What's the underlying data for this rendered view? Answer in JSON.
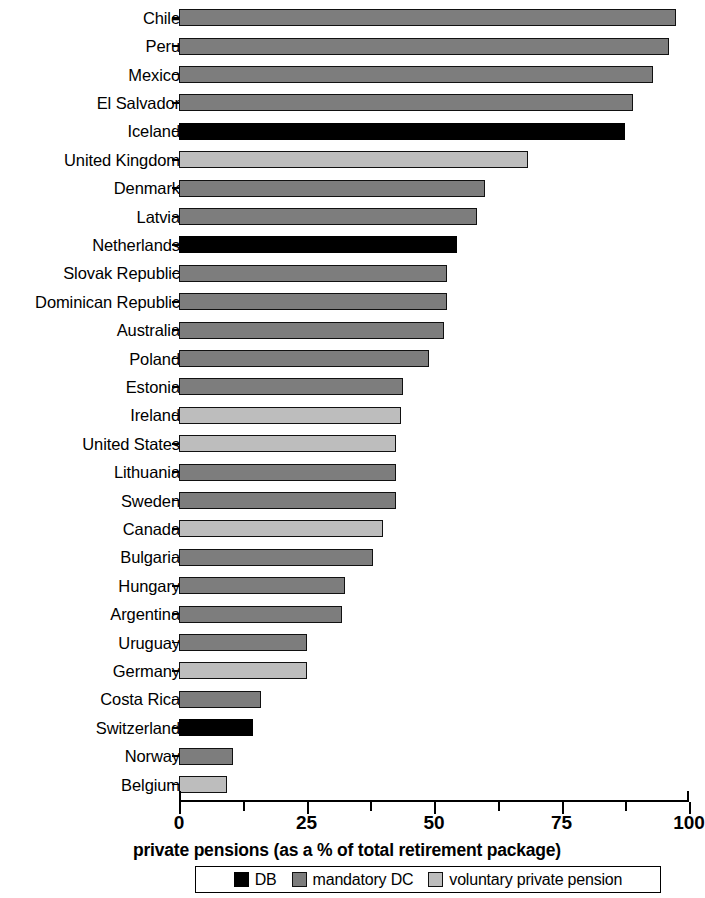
{
  "chart_data": {
    "type": "bar",
    "orientation": "horizontal",
    "title": "",
    "xlabel": "private pensions (as a % of total retirement package)",
    "ylabel": "",
    "xlim": [
      0,
      100
    ],
    "xticks": [
      0,
      25,
      50,
      75,
      100
    ],
    "xtick_labels": [
      "0",
      "25",
      "50",
      "75",
      "100"
    ],
    "minor_xticks": [
      12.5,
      37.5,
      62.5,
      87.5
    ],
    "grid": false,
    "legend_position": "bottom",
    "categories": [
      "Chile",
      "Peru",
      "Mexico",
      "El Salvador",
      "Iceland",
      "United Kingdom",
      "Denmark",
      "Latvia",
      "Netherlands",
      "Slovak Republic",
      "Dominican Republic",
      "Australia",
      "Poland",
      "Estonia",
      "Ireland",
      "United States",
      "Lithuania",
      "Sweden",
      "Canada",
      "Bulgaria",
      "Hungary",
      "Argentina",
      "Uruguay",
      "Germany",
      "Costa Rica",
      "Switzerland",
      "Norway",
      "Belgium"
    ],
    "values": [
      97.5,
      96,
      93,
      89,
      87.5,
      68.5,
      60,
      58.5,
      54.5,
      52.5,
      52.5,
      52,
      49,
      44,
      43.5,
      42.5,
      42.5,
      42.5,
      40,
      38,
      32.5,
      32,
      25,
      25,
      16,
      14.5,
      10.5,
      9.5
    ],
    "series_by_point": [
      "mandatory DC",
      "mandatory DC",
      "mandatory DC",
      "mandatory DC",
      "DB",
      "voluntary private pension",
      "mandatory DC",
      "mandatory DC",
      "DB",
      "mandatory DC",
      "mandatory DC",
      "mandatory DC",
      "mandatory DC",
      "mandatory DC",
      "voluntary private pension",
      "voluntary private pension",
      "mandatory DC",
      "mandatory DC",
      "voluntary private pension",
      "mandatory DC",
      "mandatory DC",
      "mandatory DC",
      "mandatory DC",
      "voluntary private pension",
      "mandatory DC",
      "DB",
      "mandatory DC",
      "voluntary private pension"
    ],
    "legend": [
      {
        "key": "db",
        "label": "DB",
        "color": "#000000"
      },
      {
        "key": "mdc",
        "label": "mandatory DC",
        "color": "#7d7d7d"
      },
      {
        "key": "vpp",
        "label": "voluntary private pension",
        "color": "#bdbdbd"
      }
    ]
  }
}
